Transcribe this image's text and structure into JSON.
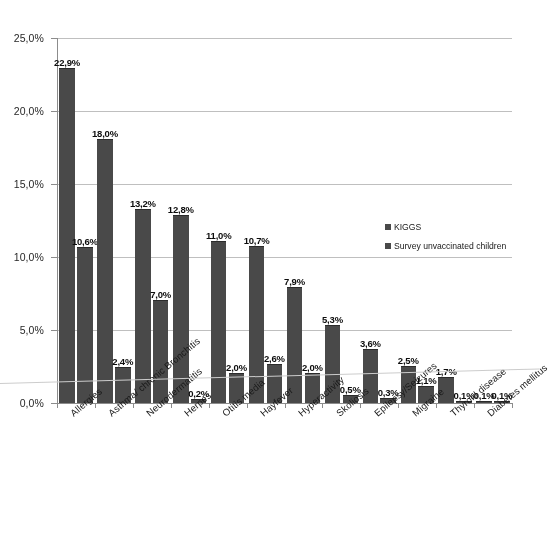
{
  "chart_data": {
    "type": "bar",
    "title": "",
    "xlabel": "",
    "ylabel": "",
    "ylim": [
      0,
      25
    ],
    "grid": true,
    "legend_position": "inside-center-right",
    "ytick_labels": [
      "0,0%",
      "5,0%",
      "10,0%",
      "15,0%",
      "20,0%",
      "25,0%"
    ],
    "ytick_values": [
      0,
      5,
      10,
      15,
      20,
      25
    ],
    "categories": [
      "Allergies",
      "Asthma/ chronic Bronchitis",
      "Neurodermatitis",
      "Herpes",
      "Otitis media",
      "Hayfever",
      "Hyperactivity",
      "Skoliosis",
      "Epilepsy/Seizures",
      "Migraine",
      "Thyroid disease",
      "Diabetes mellitus"
    ],
    "series": [
      {
        "name": "KIGGS",
        "color": "#4b4b4b",
        "values": [
          22.9,
          18.0,
          13.2,
          12.8,
          11.0,
          10.7,
          7.9,
          5.3,
          3.6,
          2.5,
          1.7,
          0.1
        ],
        "labels": [
          "22,9%",
          "18,0%",
          "13,2%",
          "12,8%",
          "11,0%",
          "10,7%",
          "7,9%",
          "5,3%",
          "3,6%",
          "2,5%",
          "1,7%",
          "0,1%"
        ]
      },
      {
        "name": "Survey unvaccinated children",
        "color": "#4b4b4b",
        "values": [
          10.6,
          2.4,
          7.0,
          0.2,
          2.0,
          2.6,
          2.0,
          0.5,
          0.3,
          1.1,
          0.1,
          0.1
        ],
        "labels": [
          "10,6%",
          "2,4%",
          "7,0%",
          "0,2%",
          "2,0%",
          "2,6%",
          "2,0%",
          "0,5%",
          "0,3%",
          "1,1%",
          "0,1%",
          "0,1%"
        ]
      }
    ]
  }
}
